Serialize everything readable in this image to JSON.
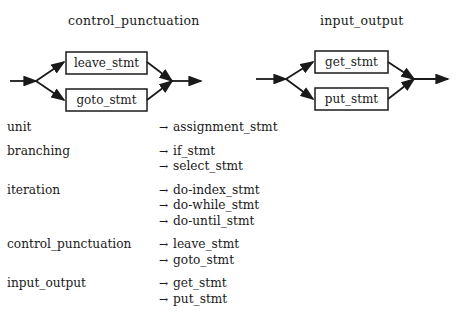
{
  "diagrams": [
    {
      "title": "control_punctuation",
      "branches": [
        "leave_stmt",
        "goto_stmt"
      ]
    },
    {
      "title": "input_output",
      "branches": [
        "get_stmt",
        "put_stmt"
      ]
    }
  ],
  "arrow_glyph": "→",
  "rules": [
    {
      "lhs": "unit",
      "alternatives": [
        "assignment_stmt"
      ]
    },
    {
      "lhs": "branching",
      "alternatives": [
        "if_stmt",
        "select_stmt"
      ]
    },
    {
      "lhs": "iteration",
      "alternatives": [
        "do-index_stmt",
        "do-while_stmt",
        "do-until_stmt"
      ]
    },
    {
      "lhs": "control_punctuation",
      "alternatives": [
        "leave_stmt",
        "goto_stmt"
      ]
    },
    {
      "lhs": "input_output",
      "alternatives": [
        "get_stmt",
        "put_stmt"
      ]
    }
  ]
}
